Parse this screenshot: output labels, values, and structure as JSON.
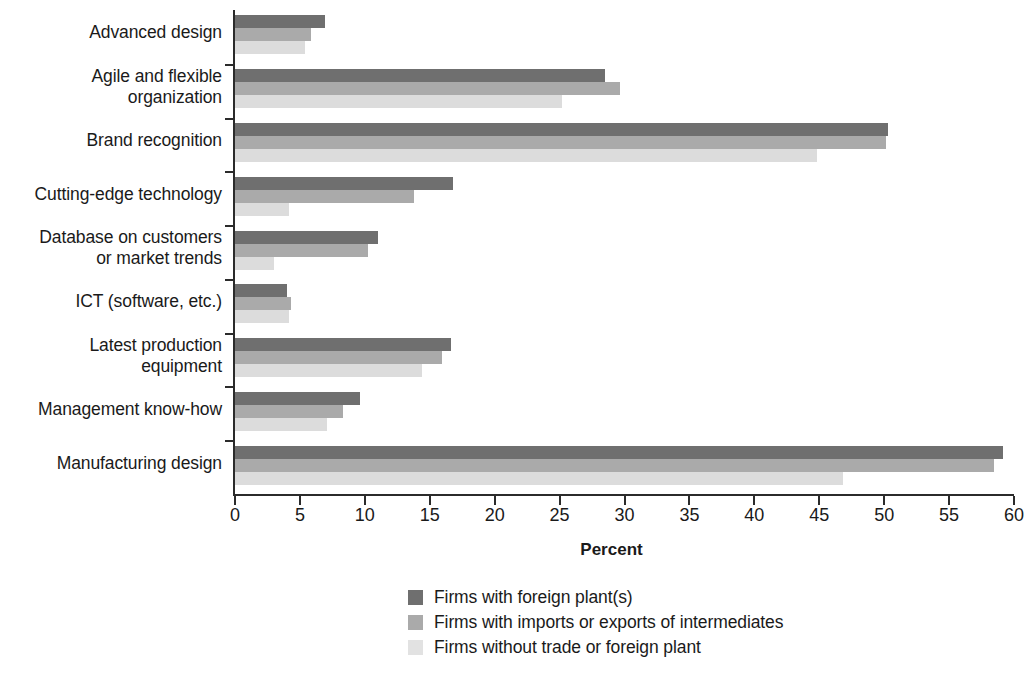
{
  "chart_data": {
    "type": "bar",
    "orientation": "horizontal",
    "title": "",
    "xlabel": "Percent",
    "ylabel": "",
    "xlim": [
      0,
      60
    ],
    "xticks": [
      0,
      5,
      10,
      15,
      20,
      25,
      30,
      35,
      40,
      45,
      50,
      55,
      60
    ],
    "xtick_labels": [
      "0",
      "5",
      "10",
      "15",
      "20",
      "25",
      "30",
      "35",
      "40",
      "45",
      "50",
      "55",
      "60"
    ],
    "grid": false,
    "legend_position": "bottom-center",
    "categories": [
      "Advanced design",
      "Agile and flexible organization",
      "Brand recognition",
      "Cutting-edge technology",
      "Database on customers or market trends",
      "ICT (software, etc.)",
      "Latest production equipment",
      "Management know-how",
      "Manufacturing design"
    ],
    "category_lines": [
      [
        "Advanced design"
      ],
      [
        "Agile and flexible",
        "organization"
      ],
      [
        "Brand recognition"
      ],
      [
        "Cutting-edge technology"
      ],
      [
        "Database on customers",
        "or market trends"
      ],
      [
        "ICT (software, etc.)"
      ],
      [
        "Latest production",
        "equipment"
      ],
      [
        "Management know-how"
      ],
      [
        "Manufacturing design"
      ]
    ],
    "series": [
      {
        "name": "Firms with foreign plant(s)",
        "color": "#6f6f6f",
        "values": [
          7.0,
          28.6,
          50.4,
          16.9,
          11.1,
          4.1,
          16.7,
          9.7,
          59.2
        ]
      },
      {
        "name": "Firms with imports or exports of intermediates",
        "color": "#aaaaaa",
        "values": [
          5.9,
          29.7,
          50.2,
          13.9,
          10.3,
          4.4,
          16.0,
          8.4,
          58.5
        ]
      },
      {
        "name": "Firms without trade or foreign plant",
        "color": "#dcdcdc",
        "values": [
          5.5,
          25.3,
          44.9,
          4.2,
          3.1,
          4.2,
          14.5,
          7.2,
          46.9
        ]
      }
    ]
  },
  "legend": {
    "items": [
      {
        "label": "Firms with foreign plant(s)",
        "swatch": "#6f6f6f"
      },
      {
        "label": "Firms with imports or exports of intermediates",
        "swatch": "#aaaaaa"
      },
      {
        "label": "Firms without trade or foreign plant",
        "swatch": "#e2e2e2"
      }
    ]
  },
  "axis": {
    "x_title": "Percent"
  }
}
